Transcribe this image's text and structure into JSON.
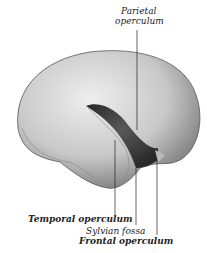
{
  "figure": {
    "labels": {
      "parietal_line1": "Parietal",
      "parietal_line2": "operculum",
      "temporal": "Temporal operculum",
      "sylvian": "Sylvian fossa",
      "frontal": "Frontal operculum"
    }
  }
}
